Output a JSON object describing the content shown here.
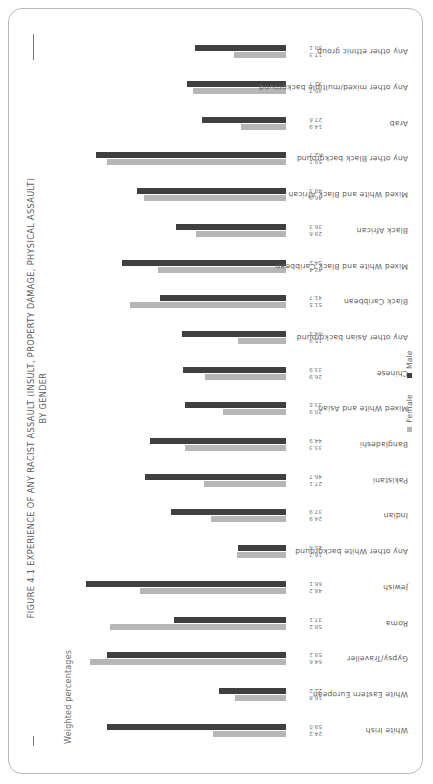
{
  "figure": {
    "title_line1": "FIGURE 4.1 EXPERIENCE OF ANY RACIST ASSAULT (INSULT, PROPERTY DAMAGE, PHYSICAL ASSAULT)",
    "title_line2": "BY GENDER",
    "subtitle": "Weighted percentages"
  },
  "legend": {
    "female_label": "Female",
    "male_label": "Male",
    "female_color": "#b6b6b6",
    "male_color": "#3f3f3f"
  },
  "chart_data": {
    "type": "bar",
    "title": "FIGURE 4.1 EXPERIENCE OF ANY RACIST ASSAULT (INSULT, PROPERTY DAMAGE, PHYSICAL ASSAULT) BY GENDER",
    "subtitle": "Weighted percentages",
    "xlabel": "",
    "ylabel": "Weighted percentages",
    "ylim": [
      0,
      70
    ],
    "grid": false,
    "legend_position": "bottom",
    "orientation": "vertical-grouped",
    "categories": [
      "White Irish",
      "White Eastern European",
      "Gypsy/Traveller",
      "Roma",
      "Jewish",
      "Any other White background",
      "Indian",
      "Pakistani",
      "Bangladeshi",
      "Mixed White and Asian",
      "Chinese",
      "Any other Asian background",
      "Black Caribbean",
      "Mixed White and Black Caribbean",
      "Black African",
      "Mixed White and Black African",
      "Any other Black background",
      "Arab",
      "Any other mixed/multiple background",
      "Any other ethnic group"
    ],
    "series": [
      {
        "name": "Female",
        "color": "#b6b6b6",
        "values": [
          24.2,
          16.8,
          64.6,
          58.2,
          48.2,
          16.2,
          24.9,
          27.1,
          33.3,
          20.9,
          26.9,
          15.9,
          51.5,
          42.4,
          29.6,
          46.9,
          59.1,
          14.9,
          30.7,
          17.3
        ]
      },
      {
        "name": "Male",
        "color": "#3f3f3f",
        "values": [
          59.0,
          22.2,
          59.2,
          37.1,
          66.1,
          15.8,
          37.9,
          46.7,
          44.9,
          33.5,
          33.9,
          34.5,
          41.7,
          54.2,
          36.3,
          49.3,
          62.7,
          27.6,
          32.7,
          30.1
        ]
      }
    ],
    "value_labels": [
      [
        "24.2",
        "59.0"
      ],
      [
        "16.8",
        "22.2"
      ],
      [
        "64.6",
        "59.2"
      ],
      [
        "58.2",
        "37.1"
      ],
      [
        "48.2",
        "66.1"
      ],
      [
        "16.2",
        "15.8"
      ],
      [
        "24.9",
        "37.9"
      ],
      [
        "27.1",
        "46.7"
      ],
      [
        "33.3",
        "44.9"
      ],
      [
        "20.9",
        "33.5"
      ],
      [
        "26.9",
        "33.9"
      ],
      [
        "15.9",
        "34.5"
      ],
      [
        "51.5",
        "41.7"
      ],
      [
        "42.4",
        "54.2"
      ],
      [
        "29.6",
        "36.3"
      ],
      [
        "46.9",
        "49.3"
      ],
      [
        "59.1",
        "62.7"
      ],
      [
        "14.9",
        "27.6"
      ],
      [
        "30.7",
        "32.7"
      ],
      [
        "17.3",
        "30.1"
      ]
    ]
  }
}
